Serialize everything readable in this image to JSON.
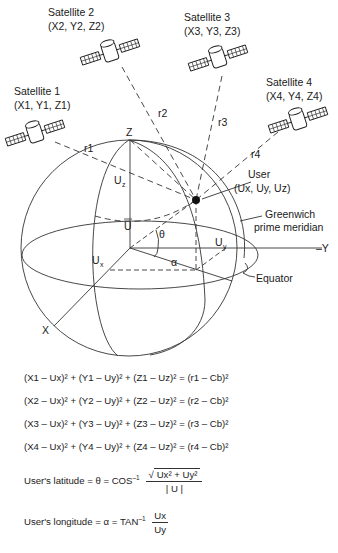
{
  "satellites": [
    {
      "name": "Satellite 1",
      "coords": "(X1, Y1, Z1)",
      "range": "r1"
    },
    {
      "name": "Satellite 2",
      "coords": "(X2, Y2, Z2)",
      "range": "r2"
    },
    {
      "name": "Satellite 3",
      "coords": "(X3, Y3, Z3)",
      "range": "r3"
    },
    {
      "name": "Satellite 4",
      "coords": "(X4, Y4, Z4)",
      "range": "r4"
    }
  ],
  "axes": {
    "x": "X",
    "y": "–Y",
    "z": "Z"
  },
  "user": {
    "label": "User",
    "coords": "(Ux, Uy, Uz)"
  },
  "labels": {
    "greenwich": [
      "Greenwich",
      "prime meridian"
    ],
    "equator": "Equator",
    "u_vector": "U",
    "theta": "θ",
    "alpha": "α",
    "ux": "U",
    "uy": "U",
    "uz": "U"
  },
  "equations": [
    "(X1 – Ux)² + (Y1 – Uy)² + (Z1 – Uz)² = (r1 – Cb)²",
    "(X2 – Ux)² + (Y2 – Uy)² + (Z2 – Uz)² = (r2 – Cb)²",
    "(X3 – Ux)² + (Y3 – Uy)² + (Z3 – Uz)² = (r3 – Cb)²",
    "(X4 – Ux)² + (Y4 – Uy)² + (Z4 – Uz)² = (r4 – Cb)²"
  ],
  "latitude": {
    "prefix": "User's latitude = θ = COS",
    "inv": "–1",
    "numerator": "Ux² + Uy²",
    "denominator": "| U |"
  },
  "longitude": {
    "prefix": "User's longitude = α = TAN",
    "inv": "–1",
    "numerator": "Ux",
    "denominator": "Uy"
  }
}
